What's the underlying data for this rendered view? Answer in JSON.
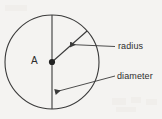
{
  "diagram": {
    "background_color": "#f4f3f1",
    "stroke_color": "#3a3a3a",
    "text_color": "#2e2e2e",
    "center_label": "A",
    "labels": {
      "radius": "radius",
      "diameter": "diameter"
    },
    "shapes": {
      "circle": {
        "cx": 52,
        "cy": 62,
        "r": 47
      },
      "center_point": {
        "cx": 52,
        "cy": 62,
        "r": 3
      },
      "diameter_line": {
        "x1": 52,
        "y1": 15,
        "x2": 52,
        "y2": 109
      },
      "radius_line": {
        "x1": 52,
        "y1": 62,
        "x2": 87,
        "y2": 31
      }
    },
    "leaders": [
      {
        "name": "radius-leader",
        "from_x": 115,
        "from_y": 46,
        "to_x": 68,
        "to_y": 45,
        "arrow": "left"
      },
      {
        "name": "diameter-leader",
        "from_x": 115,
        "from_y": 76,
        "to_x": 53,
        "to_y": 92,
        "arrow": "left"
      }
    ]
  }
}
